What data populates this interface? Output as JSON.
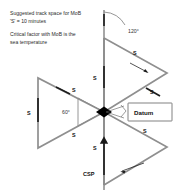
{
  "diagram": {
    "notes": [
      "Suggested track space for MoB",
      "'S' = 10 minutes",
      "Critical factor with MoB is the",
      "sea temperature"
    ],
    "angles": {
      "outer": "120°",
      "inner": "60°"
    },
    "datum": {
      "label": "Datum"
    },
    "commence_search_point": {
      "label": "CSP"
    },
    "leg_labels": {
      "top_right_upper": "S",
      "top_right_lower": "S",
      "center_upper": "S",
      "left_upper": "S",
      "left_vertical": "S",
      "left_lower": "S",
      "bottom_right": "S",
      "center_lower": "S"
    },
    "colors": {
      "track": "#8f8f8f",
      "accent": "#1d1d1d",
      "text": "#2b2b2b",
      "background": "#ffffff"
    }
  }
}
